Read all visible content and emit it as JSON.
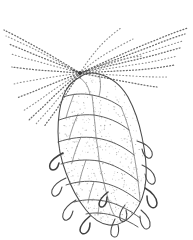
{
  "figure": {
    "medium": "pen-and-ink stipple drawing",
    "caption": "",
    "canvas": {
      "width": 193,
      "height": 240,
      "background": "#ffffff"
    }
  },
  "palette": {
    "background": "#ffffff",
    "outline_ink": "#4a4a4a",
    "seam_ink": "#555555",
    "light_seam_ink": "#6e6e6e",
    "hook_ink": "#3f3f3f",
    "needle_ink": "#6b6b6b",
    "needle_faint_ink": "#8d8d8d",
    "stipple_ink": "#8a8a8a",
    "node_ink": "#3a3a3a"
  },
  "annotations": {
    "labels": [],
    "scale_bar": "",
    "figure_number": ""
  },
  "chart_data": {
    "type": "scatter",
    "xlabel": "",
    "ylabel": "",
    "node": {
      "x": 80,
      "y": 73
    },
    "cone_axis": {
      "x1": 80,
      "y1": 76,
      "x2": 106,
      "y2": 222
    },
    "cone_extent": {
      "left": 57,
      "right": 150,
      "top": 72,
      "bottom": 225
    },
    "needle_count": 22,
    "scale_row_count": 8,
    "hook_count": 11
  },
  "geometry": {
    "cone_outline": "M 80 77 C 72 81 66 88 63 97 C 59 108 58 120 58 132 C 58 146 61 160 66 173 C 71 187 78 200 86 210 C 93 219 101 224 109 225 C 118 226 127 221 134 213 C 141 204 145 192 146 179 C 147 165 145 151 142 137 C 139 122 134 108 128 97 C 121 85 110 77 99 74 C 92 72 85 73 80 77 Z",
    "scale_seams": [
      "M 63 97 C 72 94 82 93 92 95 C 103 97 113 101 121 107",
      "M 59 120 C 70 116 82 114 94 115 C 107 117 119 122 129 130",
      "M 58 142 C 70 138 83 136 96 138 C 110 140 123 146 134 155",
      "M 61 164 C 73 160 86 159 99 161 C 113 164 126 171 138 181",
      "M 66 185 C 78 181 91 180 104 183 C 117 186 129 193 140 202",
      "M 74 202 C 85 199 97 199 109 202 C 120 205 131 211 140 218",
      "M 86 214 C 95 212 105 213 115 216 C 124 219 132 223 138 227",
      "M 80 78 C 86 82 89 88 90 95",
      "M 99 74 C 101 82 101 89 99 96",
      "M 92 95 C 93 104 94 112 94 115",
      "M 121 107 C 124 114 127 122 129 130",
      "M 74 94 C 71 102 68 110 66 118",
      "M 94 115 C 95 125 96 133 96 138",
      "M 129 130 C 132 139 133 148 134 155",
      "M 78 114 C 74 123 71 131 69 140",
      "M 96 138 C 98 148 99 156 99 161",
      "M 134 155 C 136 165 137 174 138 181",
      "M 81 137 C 77 146 74 154 72 163",
      "M 99 161 C 101 171 103 179 104 183",
      "M 138 181 C 139 190 140 197 140 202",
      "M 86 160 C 83 169 80 177 79 185",
      "M 104 183 C 106 192 108 198 109 202",
      "M 94 182 C 91 190 89 197 88 203",
      "M 109 202 C 111 209 113 214 115 216",
      "M 100 201 C 99 207 98 212 98 215"
    ],
    "hooks": [
      "M 63 153 C 57 156 52 159 50 164 C 49 167 50 170 53 170 C 56 170 58 167 59 163",
      "M 66 178 C 59 181 54 185 52 190 C 51 194 53 197 56 196 C 59 195 61 191 62 187",
      "M 76 200 C 69 204 64 209 63 214 C 62 218 64 221 67 220 C 70 219 72 215 73 211",
      "M 90 216 C 84 221 80 226 80 230 C 80 233 83 235 86 233 C 89 231 90 227 90 223",
      "M 137 141 C 144 143 150 147 152 152 C 153 156 151 159 148 158 C 145 157 143 153 142 149",
      "M 142 165 C 149 168 154 173 155 178 C 156 182 154 185 151 184 C 148 183 146 179 145 174",
      "M 145 188 C 152 192 157 198 157 203 C 157 207 154 209 151 207 C 148 205 147 200 147 196",
      "M 141 210 C 147 215 151 221 150 226 C 149 229 146 230 144 228 C 141 225 140 221 140 216",
      "M 115 219 C 112 225 110 230 111 234 C 112 237 115 238 117 236 C 119 233 119 229 118 225",
      "M 108 192 C 103 196 99 200 99 204 C 99 207 102 208 104 206 C 106 204 107 200 107 197",
      "M 125 205 C 121 210 119 215 120 219 C 121 222 124 222 126 220 C 127 217 127 213 126 210"
    ],
    "stalk": [
      "M 80 73 L 80 78",
      "M 78 72 L 72 70",
      "M 83 72 L 89 70"
    ],
    "needles": [
      {
        "d": "M 80 73 C 105 62 130 50 156 40 C 168 35 178 31 188 28",
        "faint": false
      },
      {
        "d": "M 80 73 C 104 64 128 55 152 46 C 164 41 175 37 185 34",
        "faint": false
      },
      {
        "d": "M 80 73 C 102 66 125 59 148 52 C 161 48 172 44 183 41",
        "faint": true
      },
      {
        "d": "M 80 73 C 100 68 121 63 143 58 C 156 55 168 51 180 48",
        "faint": false
      },
      {
        "d": "M 80 73 C 99 70 119 67 139 64 C 153 62 165 59 177 56",
        "faint": true
      },
      {
        "d": "M 80 73 C 98 72 117 71 136 70 C 150 69 163 67 175 65",
        "faint": false
      },
      {
        "d": "M 80 73 C 97 74 115 75 133 76 C 146 77 157 77 167 77",
        "faint": true
      },
      {
        "d": "M 80 73 C 95 76 111 79 127 82 C 138 84 148 86 157 87",
        "faint": false
      },
      {
        "d": "M 80 73 C 62 62 44 51 27 42 C 18 37 10 33 4 30",
        "faint": false
      },
      {
        "d": "M 80 73 C 63 64 46 55 30 47 C 21 43 13 39 6 36",
        "faint": true
      },
      {
        "d": "M 80 73 C 64 66 48 60 33 54 C 24 50 16 47 9 44",
        "faint": false
      },
      {
        "d": "M 80 73 C 65 69 50 65 36 61 C 27 59 18 56 11 54",
        "faint": true
      },
      {
        "d": "M 80 73 C 66 72 52 71 38 70 C 28 69 19 68 12 67",
        "faint": false
      },
      {
        "d": "M 80 73 C 66 75 53 77 40 79 C 30 81 21 82 14 84",
        "faint": true
      },
      {
        "d": "M 80 73 C 67 78 54 83 42 88 C 33 92 24 95 17 98",
        "faint": false
      },
      {
        "d": "M 80 73 C 68 80 56 88 45 96 C 37 102 29 107 23 111",
        "faint": true
      },
      {
        "d": "M 80 73 C 69 82 58 92 48 102 C 41 109 34 115 29 120",
        "faint": false
      },
      {
        "d": "M 80 73 C 70 84 61 95 52 106 C 46 113 40 119 36 124",
        "faint": true
      },
      {
        "d": "M 80 73 C 72 85 64 97 57 109 C 52 116 47 122 44 127",
        "faint": false
      },
      {
        "d": "M 80 73 C 90 69 101 65 113 62 C 123 59 133 57 142 56",
        "faint": true
      },
      {
        "d": "M 80 73 C 88 66 97 59 107 53 C 116 48 125 43 133 39",
        "faint": true
      },
      {
        "d": "M 80 73 C 86 63 93 54 101 45 C 108 38 115 32 121 28",
        "faint": true
      }
    ]
  }
}
